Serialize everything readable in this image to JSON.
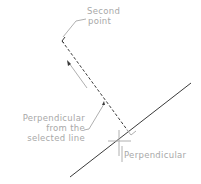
{
  "diagram": {
    "labels": {
      "second_point": [
        "Second",
        "point"
      ],
      "perp_from": [
        "Perpendicular",
        "from the",
        "selected line"
      ],
      "perpendicular": "Perpendicular"
    },
    "colors": {
      "line": "#3a3a3a",
      "leader": "#b0b0b0",
      "text": "#a8a8a8"
    }
  }
}
